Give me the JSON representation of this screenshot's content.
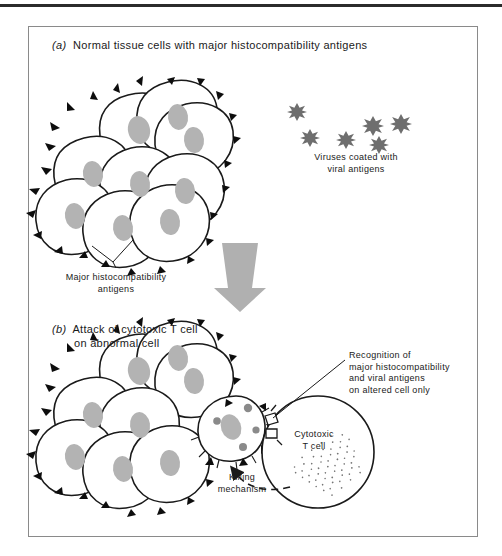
{
  "figure": {
    "panels": [
      {
        "index": "(a)",
        "title": "Normal tissue cells with major histocompatibility antigens"
      },
      {
        "index": "(b)",
        "title_line1": "Attack of cytotoxic T cell",
        "title_line2": "on abnormal cell"
      }
    ],
    "labels": {
      "viruses_line1": "Viruses coated with",
      "viruses_line2": "viral antigens",
      "mhc_line1": "Major histocompatibility",
      "mhc_line2": "antigens",
      "recognition_line1": "Recognition of",
      "recognition_line2": "major histocompatibility",
      "recognition_line3": "and viral antigens",
      "recognition_line4": "on altered cell only",
      "tcell_line1": "Cytotoxic",
      "tcell_line2": "T cell",
      "killing_line1": "Killing",
      "killing_line2": "mechanism"
    },
    "colors": {
      "ink": "#1a1a1a",
      "nucleus_gray": "#b3b3b3",
      "virus_gray": "#6e6e6e",
      "arrow_gray": "#b0b0b0",
      "border_gray": "#8a8a8a",
      "cell_fill": "#ffffff"
    },
    "counts": {
      "viruses": 6,
      "cells_panel_a": 9,
      "cells_panel_b": 9
    }
  }
}
